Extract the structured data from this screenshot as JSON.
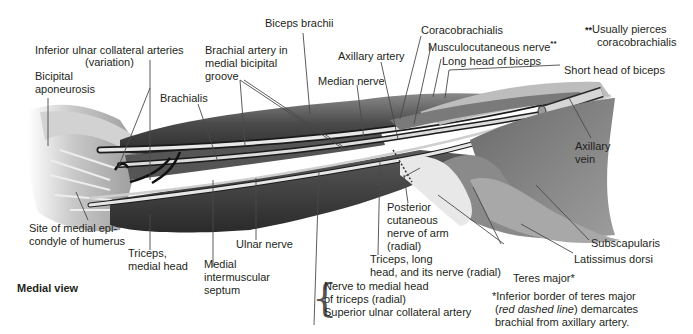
{
  "figure": {
    "view_label": "Medial view",
    "palette": {
      "background": "#ffffff",
      "text": "#231f20",
      "leader_line": "#4a4a4a",
      "muscle_dark": "#3c3c3c",
      "muscle_mid": "#6e6e6e",
      "muscle_light": "#bdbdbd",
      "tendon": "#e6e6e6",
      "vessel": "#d9d9d9",
      "vessel_dark": "#1e1e1e"
    },
    "labels": {
      "biceps_brachii": "Biceps brachii",
      "inferior_ulnar_line1": "Inferior ulnar collateral arteries",
      "inferior_ulnar_line2": "(variation)",
      "bicipital_line1": "Bicipital",
      "bicipital_line2": "aponeurosis",
      "brachial_line1": "Brachial artery in",
      "brachial_line2": "medial bicipital",
      "brachial_line3": "groove",
      "brachialis": "Brachialis",
      "axillary_artery": "Axillary artery",
      "median_nerve": "Median nerve",
      "coracobrachialis": "Coracobrachialis",
      "musculocutaneous": "Musculocutaneous nerve",
      "musculocutaneous_mark": "**",
      "long_head_biceps": "Long head of biceps",
      "short_head_biceps": "Short head of biceps",
      "note_double_mark": "**",
      "note_double_line1": "Usually pierces",
      "note_double_line2": "coracobrachialis",
      "axillary_vein_line1": "Axillary",
      "axillary_vein_line2": "vein",
      "site_line1": "Site of medial epi-",
      "site_line2": "condyle of humerus",
      "triceps_medial_line1": "Triceps,",
      "triceps_medial_line2": "medial head",
      "ulnar_nerve": "Ulnar nerve",
      "medial_septum_line1": "Medial",
      "medial_septum_line2": "intermuscular",
      "medial_septum_line3": "septum",
      "posterior_line1": "Posterior",
      "posterior_line2": "cutaneous",
      "posterior_line3": "nerve of arm",
      "posterior_line4": "(radial)",
      "triceps_long_line1": "Triceps, long",
      "triceps_long_line2": "head, and its nerve (radial)",
      "nerve_medial_line1": "Nerve to medial head",
      "nerve_medial_line2": "of triceps (radial)",
      "superior_ulnar": "Superior ulnar collateral artery",
      "subscapularis": "Subscapularis",
      "latissimus": "Latissimus dorsi",
      "teres_major": "Teres major*",
      "note_single_line1": "*Inferior border of teres major",
      "note_single_open": "(",
      "note_single_italic": "red dashed line",
      "note_single_rest": ") demarcates",
      "note_single_line3": "brachial from axillary artery."
    }
  }
}
